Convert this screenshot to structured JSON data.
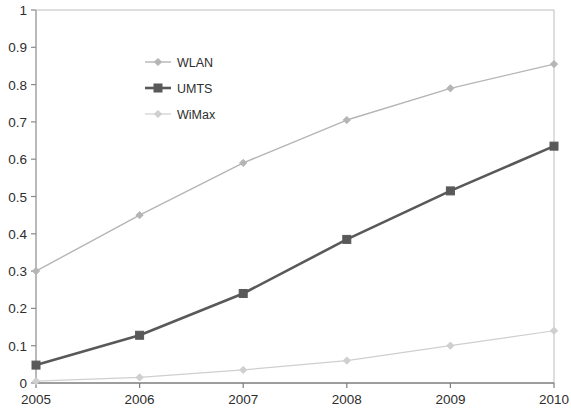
{
  "chart_data": {
    "type": "line",
    "title": "",
    "subtitle": "",
    "xlabel": "",
    "ylabel": "",
    "x": [
      2005,
      2006,
      2007,
      2008,
      2009,
      2010
    ],
    "categories": [
      "2005",
      "2006",
      "2007",
      "2008",
      "2009",
      "2010"
    ],
    "xtick_labels": [
      "2005",
      "2006",
      "2007",
      "2008",
      "2009",
      "2010"
    ],
    "ytick_labels": [
      "0",
      "0.1",
      "0.2",
      "0.3",
      "0.4",
      "0.5",
      "0.6",
      "0.7",
      "0.8",
      "0.9",
      "1"
    ],
    "ytick_values": [
      0,
      0.1,
      0.2,
      0.3,
      0.4,
      0.5,
      0.6,
      0.7,
      0.8,
      0.9,
      1
    ],
    "xlim": [
      2005,
      2010
    ],
    "ylim": [
      0,
      1
    ],
    "grid": false,
    "legend_position": "upper-left-inside",
    "series": [
      {
        "name": "WLAN",
        "values": [
          0.3,
          0.45,
          0.59,
          0.705,
          0.79,
          0.855
        ],
        "color": "#b5b5b5",
        "marker": "diamond",
        "line_width": 1.4
      },
      {
        "name": "UMTS",
        "values": [
          0.048,
          0.128,
          0.24,
          0.385,
          0.515,
          0.635
        ],
        "color": "#595959",
        "marker": "square",
        "line_width": 2.6
      },
      {
        "name": "WiMax",
        "values": [
          0.005,
          0.015,
          0.035,
          0.06,
          0.1,
          0.14
        ],
        "color": "#cfcfcf",
        "marker": "diamond",
        "line_width": 1.2
      }
    ]
  },
  "axes": {
    "frame_color": "#8a8a8a",
    "text_color": "#2e2e2e"
  },
  "legend": {
    "entries": [
      {
        "label": "WLAN"
      },
      {
        "label": "UMTS"
      },
      {
        "label": "WiMax"
      }
    ]
  }
}
